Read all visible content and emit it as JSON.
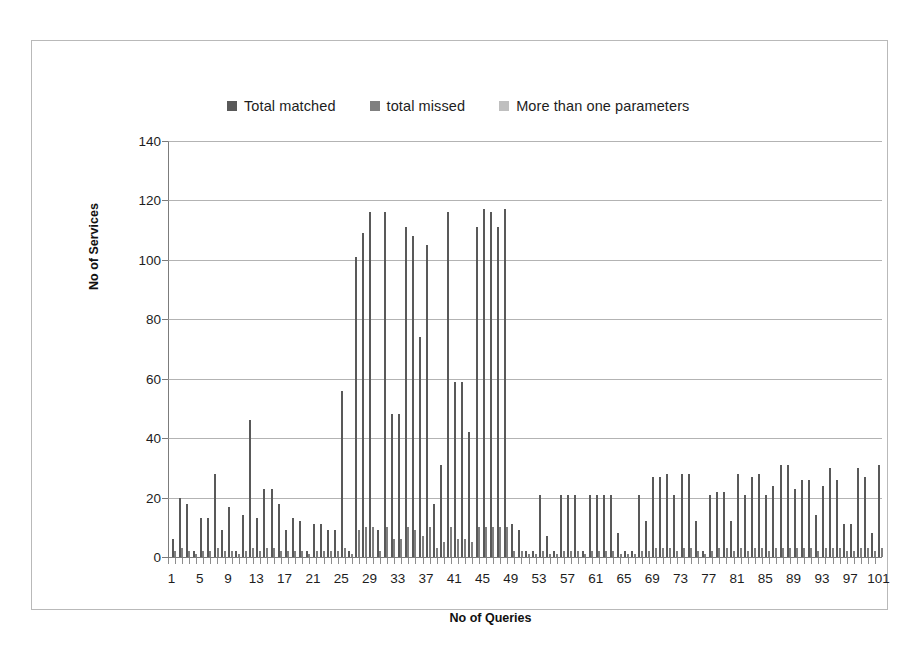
{
  "chart_data": {
    "type": "bar",
    "title": "",
    "xlabel": "No of Queries",
    "ylabel": "No of Services",
    "ylim": [
      0,
      140
    ],
    "ytick_values": [
      0,
      20,
      40,
      60,
      80,
      100,
      120,
      140
    ],
    "xlim": [
      1,
      101
    ],
    "xtick_labels": [
      "1",
      "5",
      "9",
      "13",
      "17",
      "21",
      "25",
      "29",
      "33",
      "37",
      "41",
      "45",
      "49",
      "53",
      "57",
      "61",
      "65",
      "69",
      "73",
      "77",
      "81",
      "85",
      "89",
      "93",
      "97",
      "101"
    ],
    "xtick_step": 4,
    "grid": true,
    "legend_position": "top",
    "legend": [
      "Total matched",
      "total missed",
      "More than one parameters"
    ],
    "series": [
      {
        "name": "Total matched",
        "color": "#595959",
        "values": [
          6,
          20,
          18,
          2,
          13,
          28,
          9,
          17,
          2,
          14,
          46,
          13,
          23,
          18,
          9,
          13,
          12,
          2,
          11,
          11,
          9,
          56,
          2,
          101,
          109,
          116,
          9,
          116,
          48,
          111,
          108,
          74,
          105,
          18,
          31,
          116,
          59,
          42,
          111,
          117,
          116,
          111,
          117,
          11,
          9,
          2,
          21,
          7,
          2,
          21,
          21,
          21,
          2,
          21,
          21,
          21,
          8,
          2,
          2,
          21,
          12,
          27,
          28,
          21,
          28,
          28,
          12,
          2,
          21,
          22,
          12,
          28,
          21,
          27,
          28,
          21,
          24,
          31,
          23,
          26,
          26,
          14,
          24,
          30,
          26,
          11,
          30,
          27,
          8,
          31
        ]
      },
      {
        "name": "total missed",
        "color": "#808080",
        "values": [
          2,
          3,
          2,
          1,
          2,
          3,
          2,
          2,
          1,
          2,
          3,
          2,
          3,
          2,
          2,
          2,
          2,
          1,
          2,
          2,
          2,
          3,
          1,
          9,
          10,
          10,
          2,
          10,
          6,
          10,
          9,
          7,
          10,
          3,
          5,
          10,
          6,
          5,
          10,
          10,
          10,
          10,
          10,
          2,
          2,
          1,
          2,
          1,
          1,
          2,
          2,
          2,
          1,
          2,
          2,
          2,
          1,
          1,
          1,
          2,
          2,
          3,
          3,
          2,
          3,
          3,
          2,
          1,
          2,
          3,
          2,
          3,
          2,
          3,
          3,
          2,
          3,
          3,
          3,
          3,
          3,
          2,
          3,
          3,
          3,
          2,
          3,
          3,
          2,
          3
        ]
      },
      {
        "name": "More than one parameters",
        "color": "#bfbfbf",
        "values": [
          0,
          0,
          0,
          0,
          0,
          0,
          0,
          0,
          0,
          0,
          0,
          0,
          0,
          0,
          0,
          0,
          0,
          0,
          0,
          0,
          0,
          0,
          0,
          0,
          0,
          0,
          0,
          0,
          0,
          0,
          0,
          0,
          0,
          0,
          0,
          0,
          0,
          0,
          0,
          0,
          0,
          0,
          0,
          0,
          0,
          0,
          0,
          0,
          0,
          0,
          0,
          0,
          0,
          0,
          0,
          0,
          0,
          0,
          0,
          0,
          0,
          0,
          0,
          0,
          0,
          0,
          0,
          0,
          0,
          0,
          0,
          0,
          0,
          0,
          0,
          0,
          0,
          0,
          0,
          0,
          0,
          0,
          0,
          0,
          0,
          0,
          0,
          0,
          0,
          0
        ]
      }
    ]
  }
}
